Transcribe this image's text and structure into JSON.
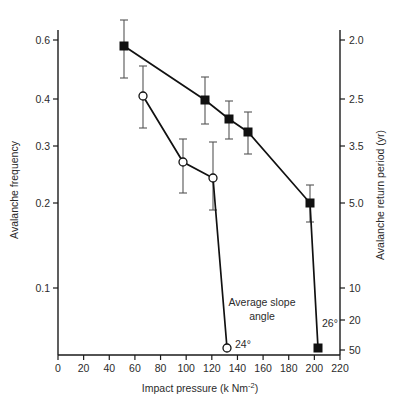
{
  "chart_data": {
    "type": "line",
    "title": "",
    "xlabel": "Impact pressure (k Nm-2)",
    "xlabel_main": "Impact pressure (k Nm",
    "xlabel_sup": "-2",
    "xlabel_tail": ")",
    "ylabel": "Avalanche frequency",
    "ylabel_right": "Avalanche return period (yr)",
    "xlim": [
      0,
      225
    ],
    "xticks": [
      0,
      20,
      40,
      60,
      80,
      100,
      120,
      140,
      160,
      180,
      200,
      220
    ],
    "xticklabels": [
      "0",
      "20",
      "40",
      "60",
      "80",
      "100",
      "120",
      "140",
      "160",
      "180",
      "200",
      "220"
    ],
    "yticks_left": [
      0.6,
      0.4,
      0.3,
      0.2,
      0.1
    ],
    "yticklabels_left": [
      "0.6",
      "0.4",
      "0.3",
      "0.2",
      "0.1"
    ],
    "yticks_left_px": [
      40,
      99,
      146,
      203,
      288
    ],
    "yticks_right": [
      2.0,
      2.5,
      3.5,
      5.0,
      10,
      20,
      50
    ],
    "yticklabels_right": [
      "2.0",
      "2.5",
      "3.5",
      "5.0",
      "10",
      "20",
      "50"
    ],
    "yticks_right_px": [
      40,
      99,
      146,
      203,
      288,
      320,
      350
    ],
    "grid": false,
    "legend": "none",
    "axis_note": "Left axis avalanche frequency, right axis is its reciprocal return period; scale is non-linear",
    "series": [
      {
        "name": "26",
        "label": "26°",
        "marker": "filled-square",
        "x": [
          55,
          118,
          137,
          152,
          200,
          206
        ],
        "y": [
          0.578,
          0.396,
          0.337,
          0.299,
          0.2,
          0.013
        ],
        "yerr_low": [
          0.435,
          0.357,
          0.305,
          0.268,
          0.178,
          null
        ],
        "yerr_high": [
          0.62,
          0.442,
          0.372,
          0.328,
          0.227,
          null
        ],
        "px": [
          124,
          205,
          229,
          248,
          310,
          318
        ],
        "py": [
          46,
          100,
          119,
          132,
          203,
          348
        ],
        "ebar_top_px": [
          20,
          77,
          101,
          112,
          185,
          null
        ],
        "ebar_bot_px": [
          78,
          124,
          139,
          154,
          222,
          null
        ]
      },
      {
        "name": "24",
        "label": "24°",
        "marker": "open-circle",
        "x": [
          70,
          101,
          124,
          132
        ],
        "y": [
          0.407,
          0.249,
          0.219,
          0.01
        ],
        "yerr_low": [
          0.352,
          0.2,
          0.163,
          null
        ],
        "yerr_high": [
          0.45,
          0.297,
          0.302,
          null
        ],
        "px": [
          143,
          183,
          213,
          227
        ],
        "py": [
          96,
          162,
          178,
          348
        ],
        "ebar_top_px": [
          66,
          139,
          142,
          null
        ],
        "ebar_bot_px": [
          128,
          193,
          210,
          null
        ]
      }
    ],
    "annotations": [
      {
        "name": "average-slope-angle-note",
        "text_line1": "Average slope",
        "text_line2": "angle",
        "x_px": 262,
        "y_px": 306
      },
      {
        "name": "series-label-24",
        "text": "24°",
        "x_px": 235,
        "y_px": 348
      },
      {
        "name": "series-label-26",
        "text": "26°",
        "x_px": 322,
        "y_px": 327
      }
    ],
    "colors": {
      "line": "#111111",
      "errorbar": "#555555",
      "text": "#2b2b2b",
      "background": "#ffffff"
    }
  }
}
